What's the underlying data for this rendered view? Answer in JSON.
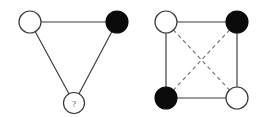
{
  "figure": {
    "background_color": "#ffffff",
    "width": 268,
    "height": 117
  },
  "style": {
    "edge_solid_color": "#3a3a3a",
    "edge_dashed_color": "#6e6e6e",
    "node_open_fill": "#ffffff",
    "node_filled_fill": "#0a0a0a",
    "node_stroke_color": "#3a3a3a",
    "label_color": "#555555"
  },
  "diagrams": [
    {
      "id": "triangle-diagram",
      "name": "triangle",
      "nodes": [
        {
          "id": "tri-top-left",
          "name": "top-left-open-node",
          "state": "open",
          "label": "",
          "cx": 30,
          "cy": 22,
          "r": 11
        },
        {
          "id": "tri-top-right",
          "name": "top-right-filled-node",
          "state": "filled",
          "label": "",
          "cx": 117,
          "cy": 22,
          "r": 11
        },
        {
          "id": "tri-bottom",
          "name": "bottom-unknown-node",
          "state": "open",
          "label": "?",
          "cx": 74,
          "cy": 103,
          "r": 10.5
        }
      ],
      "edges": [
        {
          "id": "tri-edge-top",
          "name": "edge-top-left-to-top-right",
          "style": "solid",
          "from": "tri-top-left",
          "to": "tri-top-right"
        },
        {
          "id": "tri-edge-left",
          "name": "edge-top-left-to-bottom",
          "style": "solid",
          "from": "tri-top-left",
          "to": "tri-bottom"
        },
        {
          "id": "tri-edge-right",
          "name": "edge-top-right-to-bottom",
          "style": "solid",
          "from": "tri-top-right",
          "to": "tri-bottom"
        }
      ]
    },
    {
      "id": "square-diagram",
      "name": "square",
      "nodes": [
        {
          "id": "sq-top-left",
          "name": "top-left-open-node",
          "state": "open",
          "label": "",
          "cx": 166,
          "cy": 22,
          "r": 11
        },
        {
          "id": "sq-top-right",
          "name": "top-right-filled-node",
          "state": "filled",
          "label": "",
          "cx": 237,
          "cy": 22,
          "r": 11
        },
        {
          "id": "sq-bottom-left",
          "name": "bottom-left-filled-node",
          "state": "filled",
          "label": "",
          "cx": 166,
          "cy": 98,
          "r": 11
        },
        {
          "id": "sq-bottom-right",
          "name": "bottom-right-open-node",
          "state": "open",
          "label": "",
          "cx": 237,
          "cy": 98,
          "r": 11
        }
      ],
      "edges": [
        {
          "id": "sq-edge-top",
          "name": "edge-top-side",
          "style": "solid",
          "from": "sq-top-left",
          "to": "sq-top-right"
        },
        {
          "id": "sq-edge-right",
          "name": "edge-right-side",
          "style": "solid",
          "from": "sq-top-right",
          "to": "sq-bottom-right"
        },
        {
          "id": "sq-edge-bottom",
          "name": "edge-bottom-side",
          "style": "solid",
          "from": "sq-bottom-left",
          "to": "sq-bottom-right"
        },
        {
          "id": "sq-edge-left",
          "name": "edge-left-side",
          "style": "solid",
          "from": "sq-top-left",
          "to": "sq-bottom-left"
        },
        {
          "id": "sq-edge-diag-1",
          "name": "edge-diagonal-top-left-to-bottom-right",
          "style": "dashed",
          "from": "sq-top-left",
          "to": "sq-bottom-right"
        },
        {
          "id": "sq-edge-diag-2",
          "name": "edge-diagonal-top-right-to-bottom-left",
          "style": "dashed",
          "from": "sq-top-right",
          "to": "sq-bottom-left"
        }
      ]
    }
  ]
}
